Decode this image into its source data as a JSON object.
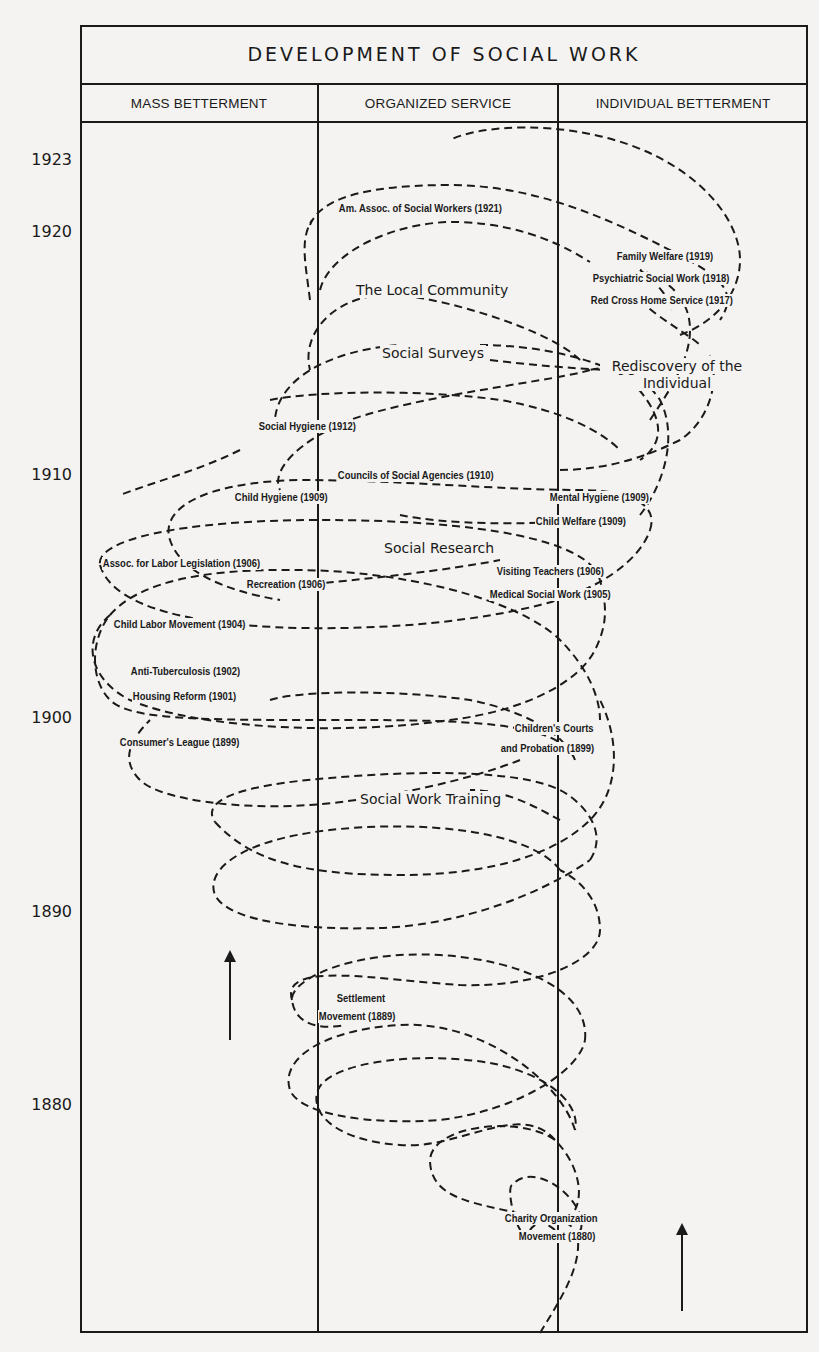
{
  "title": "DEVELOPMENT OF SOCIAL WORK",
  "columns": [
    {
      "label": "MASS BETTERMENT"
    },
    {
      "label": "ORGANIZED SERVICE"
    },
    {
      "label": "INDIVIDUAL BETTERMENT"
    }
  ],
  "years": [
    "1923",
    "1920",
    "1910",
    "1900",
    "1890",
    "1880"
  ],
  "movements": [
    {
      "label": "Am. Assoc. of Social Workers (1921)"
    },
    {
      "label": "Family Welfare (1919)"
    },
    {
      "label": "Psychiatric Social Work (1918)"
    },
    {
      "label": "Red Cross Home Service (1917)"
    },
    {
      "label": "Social Hygiene (1912)"
    },
    {
      "label": "Councils of Social Agencies (1910)"
    },
    {
      "label": "Child Hygiene (1909)"
    },
    {
      "label": "Mental Hygiene (1909)"
    },
    {
      "label": "Child Welfare (1909)"
    },
    {
      "label": "Assoc. for Labor Legislation (1906)"
    },
    {
      "label": "Recreation (1906)"
    },
    {
      "label": "Visiting Teachers (1906)"
    },
    {
      "label": "Medical Social Work (1905)"
    },
    {
      "label": "Child Labor Movement (1904)"
    },
    {
      "label": "Anti-Tuberculosis (1902)"
    },
    {
      "label": "Housing Reform (1901)"
    },
    {
      "label": "Consumer's League (1899)"
    },
    {
      "label": "Children's Courts"
    },
    {
      "label": "and Probation (1899)"
    },
    {
      "label": "Settlement"
    },
    {
      "label": "Movement (1889)"
    },
    {
      "label": "Charity Organization"
    },
    {
      "label": "Movement (1880)"
    }
  ],
  "phases": [
    {
      "label": "The Local Community"
    },
    {
      "label": "Social Surveys"
    },
    {
      "label": "Rediscovery of the"
    },
    {
      "label": "Individual"
    },
    {
      "label": "Social Research"
    },
    {
      "label": "Social Work Training"
    }
  ],
  "colors": {
    "ink": "#1a1a1a",
    "paper": "#f4f3f1"
  }
}
